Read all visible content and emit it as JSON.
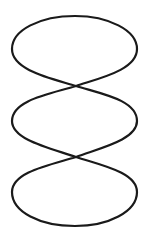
{
  "figure": {
    "stroke_color": "#1a1a1a",
    "background_color": "#ffffff",
    "stroke_width": 2.2,
    "lobes": 3,
    "crossings": [
      {
        "x": 76,
        "y": 86
      },
      {
        "x": 76,
        "y": 157
      }
    ],
    "extent": {
      "x_min": 12,
      "x_max": 137,
      "y_min": 16,
      "y_max": 226
    }
  }
}
